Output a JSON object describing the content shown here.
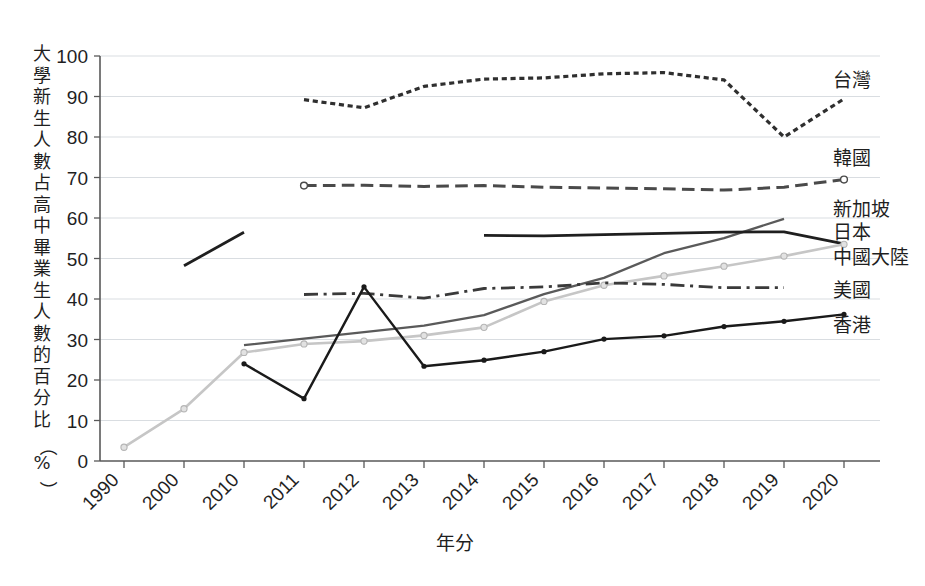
{
  "chart_data": {
    "type": "line",
    "title": "",
    "xlabel": "年分",
    "ylabel": "大學新生人數占高中畢業生人數的百分比（%）",
    "ylabel_chars": [
      "大",
      "學",
      "新",
      "生",
      "人",
      "數",
      "占",
      "高",
      "中",
      "畢",
      "業",
      "生",
      "人",
      "數",
      "的",
      "百",
      "分",
      "比",
      "（",
      "%",
      "）"
    ],
    "categories": [
      "1990",
      "2000",
      "2010",
      "2011",
      "2012",
      "2013",
      "2014",
      "2015",
      "2016",
      "2017",
      "2018",
      "2019",
      "2020"
    ],
    "ylim": [
      0,
      100
    ],
    "yticks": [
      "0",
      "10",
      "20",
      "30",
      "40",
      "50",
      "60",
      "70",
      "80",
      "90",
      "100"
    ],
    "grid": true,
    "legend_position": "right",
    "series": [
      {
        "name": "台灣",
        "color": "#2f2f2f",
        "style": "dotted",
        "width": 3.2,
        "legend_y": 80,
        "values": [
          null,
          null,
          null,
          89.2,
          87.2,
          92.5,
          94.3,
          94.6,
          95.6,
          95.9,
          94.1,
          80.0,
          89.4
        ]
      },
      {
        "name": "韓國",
        "color": "#4a4a4a",
        "style": "dashed",
        "width": 3.0,
        "legend_y": 158,
        "marker_first": "open-circle",
        "marker_last": "open-circle",
        "values": [
          null,
          null,
          null,
          68.0,
          68.1,
          67.8,
          68.0,
          67.6,
          67.4,
          67.2,
          66.9,
          67.6,
          69.5
        ]
      },
      {
        "name": "新加坡",
        "color": "#5a5a5a",
        "style": "solid",
        "width": 2.3,
        "legend_y": 209,
        "values": [
          null,
          null,
          28.6,
          30.2,
          31.8,
          33.4,
          36.0,
          41.2,
          45.2,
          51.3,
          55.0,
          59.8,
          null
        ]
      },
      {
        "name": "日本",
        "color": "#1f1f1f",
        "style": "solid",
        "width": 2.8,
        "legend_y": 232,
        "values": [
          null,
          48.2,
          56.5,
          null,
          null,
          null,
          55.7,
          55.6,
          55.9,
          56.2,
          56.5,
          56.6,
          53.6
        ]
      },
      {
        "name": "中國大陸",
        "color": "#c6c6c6",
        "style": "solid",
        "width": 2.6,
        "legend_y": 257,
        "marker": "small-circle",
        "values": [
          3.4,
          12.9,
          26.8,
          28.9,
          29.6,
          31.0,
          33.0,
          39.4,
          43.4,
          45.7,
          48.1,
          50.6,
          53.5
        ]
      },
      {
        "name": "美國",
        "color": "#3a3a3a",
        "style": "dashdot",
        "width": 2.8,
        "legend_y": 290,
        "values": [
          null,
          null,
          null,
          41.1,
          41.4,
          40.2,
          42.6,
          43.0,
          44.0,
          43.6,
          42.8,
          42.8,
          null
        ]
      },
      {
        "name": "香港",
        "color": "#1a1a1a",
        "style": "solid-marker",
        "width": 2.4,
        "legend_y": 325,
        "marker": "diamond",
        "values": [
          null,
          null,
          24.0,
          15.4,
          43.0,
          23.4,
          24.9,
          27.0,
          30.1,
          30.9,
          33.2,
          34.5,
          36.2
        ]
      }
    ]
  },
  "plot": {
    "x0": 100,
    "x1": 820,
    "y0": 56,
    "y1": 461,
    "tick_spacing": 60
  }
}
